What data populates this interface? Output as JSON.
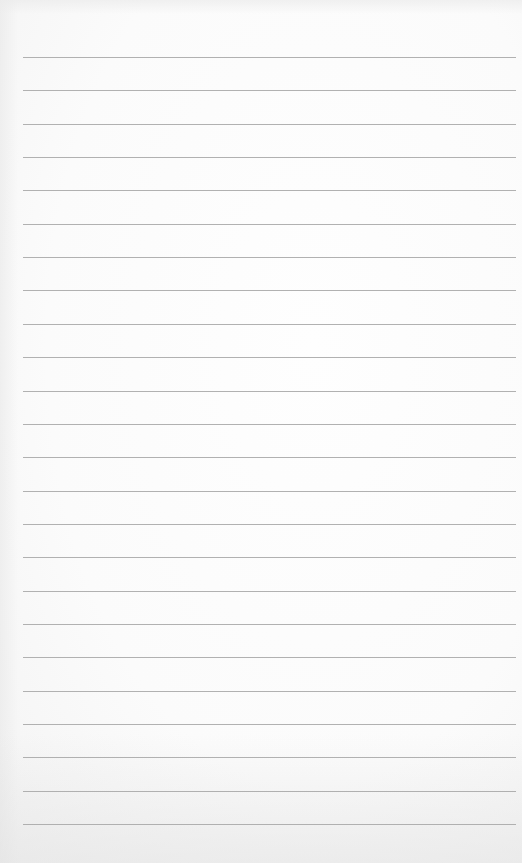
{
  "page": {
    "type": "lined-notebook-paper",
    "background_color": "#fafafa",
    "line_color": "#a9a9a9",
    "line_count": 24,
    "first_line_y": 57,
    "line_spacing": 33.35,
    "line_left": 23,
    "line_right": 516,
    "text": ""
  }
}
